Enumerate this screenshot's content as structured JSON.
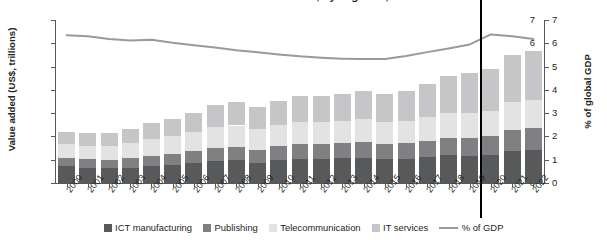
{
  "title": "Value added of the ICT sector, by segment, 2000–2022",
  "axes": {
    "left_label": "Value added (US$, trillions)",
    "right_label": "% of global GDP",
    "left_ticks": [
      "0",
      "1",
      "2",
      "3",
      "4",
      "5",
      "6",
      "7"
    ],
    "right_ticks": [
      "0",
      "1",
      "2",
      "3",
      "4",
      "5",
      "6",
      "7"
    ]
  },
  "legend": {
    "items": [
      {
        "label": "ICT manufacturing",
        "color": "#58595b",
        "marker": "square"
      },
      {
        "label": "Publishing",
        "color": "#808083",
        "marker": "square"
      },
      {
        "label": "Telecommunication",
        "color": "#e3e3e4",
        "marker": "square"
      },
      {
        "label": "IT services",
        "color": "#c6c6c8",
        "marker": "square"
      },
      {
        "label": "% of GDP",
        "color": "#9a9a9c",
        "marker": "line"
      }
    ]
  },
  "annotations": {
    "divider_after_year": "2019"
  },
  "chart_data": {
    "type": "bar",
    "title": "Value added of the ICT sector, by segment, 2000–2022",
    "xlabel": "",
    "ylabel": "Value added (US$, trillions)",
    "y2label": "% of global GDP",
    "ylim": [
      0,
      7
    ],
    "y2lim": [
      0,
      7
    ],
    "grid": false,
    "legend_position": "bottom",
    "stacked": true,
    "categories": [
      "2000",
      "2001",
      "2002",
      "2003",
      "2004",
      "2005",
      "2006",
      "2007",
      "2008",
      "2009",
      "2010",
      "2011",
      "2012",
      "2013",
      "2014",
      "2015",
      "2016",
      "2017",
      "2018",
      "2019",
      "2020",
      "2021",
      "2022"
    ],
    "series": [
      {
        "name": "ICT manufacturing",
        "color": "#58595b",
        "values": [
          0.72,
          0.66,
          0.63,
          0.66,
          0.74,
          0.79,
          0.86,
          0.93,
          0.97,
          0.88,
          1.0,
          1.05,
          1.05,
          1.06,
          1.09,
          1.05,
          1.05,
          1.12,
          1.2,
          1.18,
          1.22,
          1.38,
          1.42
        ]
      },
      {
        "name": "Publishing",
        "color": "#808083",
        "values": [
          0.36,
          0.36,
          0.37,
          0.4,
          0.44,
          0.46,
          0.5,
          0.56,
          0.58,
          0.55,
          0.58,
          0.62,
          0.62,
          0.64,
          0.66,
          0.64,
          0.66,
          0.7,
          0.75,
          0.77,
          0.8,
          0.9,
          0.95
        ]
      },
      {
        "name": "Telecommunication",
        "color": "#e3e3e4",
        "values": [
          0.58,
          0.57,
          0.58,
          0.64,
          0.7,
          0.75,
          0.82,
          0.9,
          0.92,
          0.88,
          0.92,
          0.96,
          0.95,
          0.96,
          0.98,
          0.93,
          0.95,
          1.0,
          1.05,
          1.07,
          1.08,
          1.18,
          1.2
        ]
      },
      {
        "name": "IT services",
        "color": "#c6c6c8",
        "values": [
          0.54,
          0.56,
          0.57,
          0.62,
          0.69,
          0.75,
          0.84,
          0.94,
          0.99,
          0.96,
          1.02,
          1.1,
          1.12,
          1.16,
          1.23,
          1.22,
          1.3,
          1.45,
          1.6,
          1.71,
          1.78,
          2.02,
          2.1
        ]
      }
    ],
    "totals": [
      2.2,
      2.15,
      2.15,
      2.32,
      2.57,
      2.75,
      3.02,
      3.33,
      3.46,
      3.27,
      3.52,
      3.73,
      3.74,
      3.82,
      3.96,
      3.84,
      3.96,
      4.27,
      4.6,
      4.73,
      4.88,
      5.48,
      5.67
    ],
    "line_series": {
      "name": "% of GDP",
      "color": "#9a9a9c",
      "axis": "right",
      "values": [
        6.35,
        6.3,
        6.18,
        6.12,
        6.15,
        6.02,
        5.92,
        5.82,
        5.7,
        5.62,
        5.52,
        5.44,
        5.38,
        5.34,
        5.32,
        5.33,
        5.45,
        5.62,
        5.78,
        5.95,
        6.38,
        6.3,
        6.18
      ]
    }
  }
}
